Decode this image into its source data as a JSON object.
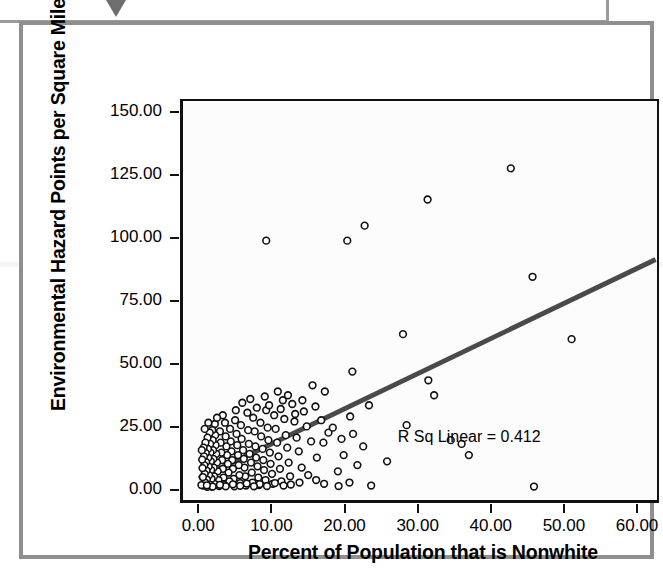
{
  "figure": {
    "marker_icon": "triangle-down-icon",
    "rsq_annotation": "R Sq Linear = 0.412"
  },
  "chart_data": {
    "type": "scatter",
    "title": "",
    "xlabel": "Percent of Population that is Nonwhite",
    "ylabel": "Environmental Hazard Points per Square Mile",
    "xlim": [
      -2.5,
      63.0
    ],
    "ylim": [
      -5.0,
      155.0
    ],
    "xticks": [
      0,
      10,
      20,
      30,
      40,
      50,
      60
    ],
    "xtick_labels": [
      "0.00",
      "10.00",
      "20.00",
      "30.00",
      "40.00",
      "50.00",
      "60.00"
    ],
    "yticks": [
      0,
      25,
      50,
      75,
      100,
      125,
      150
    ],
    "ytick_labels": [
      "0.00",
      "25.00",
      "50.00",
      "75.00",
      "100.00",
      "125.00",
      "150.00"
    ],
    "grid": false,
    "legend": null,
    "marker": {
      "style": "open-circle",
      "radius": 3.4,
      "edge_color": "#111111",
      "face_color": "#ffffff",
      "edge_width": 1.6
    },
    "annotations": [
      {
        "text": "R Sq Linear = 0.412",
        "x": 38.5,
        "y": 21.5
      }
    ],
    "fit_line": {
      "type": "linear",
      "r_squared": 0.412,
      "color": "#4a4a4a",
      "width": 5,
      "x_start": 0.0,
      "y_start": 4.0,
      "x_end": 62.5,
      "y_end": 91.0
    },
    "points": [
      [
        9.0,
        99.0
      ],
      [
        20.2,
        99.0
      ],
      [
        22.6,
        105.0
      ],
      [
        31.3,
        115.5
      ],
      [
        42.8,
        128.0
      ],
      [
        45.8,
        84.5
      ],
      [
        51.2,
        59.5
      ],
      [
        27.9,
        61.5
      ],
      [
        31.4,
        43.0
      ],
      [
        32.2,
        37.0
      ],
      [
        20.9,
        46.5
      ],
      [
        23.2,
        33.0
      ],
      [
        17.1,
        38.5
      ],
      [
        15.4,
        41.0
      ],
      [
        28.4,
        25.0
      ],
      [
        34.5,
        19.0
      ],
      [
        37.0,
        13.0
      ],
      [
        36.0,
        17.5
      ],
      [
        46.0,
        0.4
      ],
      [
        25.7,
        10.5
      ],
      [
        22.4,
        16.5
      ],
      [
        21.0,
        21.5
      ],
      [
        20.6,
        28.5
      ],
      [
        19.7,
        13.0
      ],
      [
        18.9,
        6.5
      ],
      [
        17.6,
        22.0
      ],
      [
        16.6,
        27.0
      ],
      [
        16.0,
        12.0
      ],
      [
        15.2,
        18.5
      ],
      [
        14.6,
        24.5
      ],
      [
        14.2,
        30.5
      ],
      [
        13.9,
        8.0
      ],
      [
        13.5,
        14.5
      ],
      [
        13.2,
        20.0
      ],
      [
        12.9,
        26.5
      ],
      [
        12.6,
        33.5
      ],
      [
        12.3,
        4.5
      ],
      [
        12.1,
        10.0
      ],
      [
        11.9,
        16.0
      ],
      [
        11.7,
        21.0
      ],
      [
        11.5,
        27.5
      ],
      [
        11.3,
        35.0
      ],
      [
        11.1,
        2.5
      ],
      [
        10.9,
        7.5
      ],
      [
        10.7,
        12.5
      ],
      [
        10.5,
        18.0
      ],
      [
        10.3,
        23.5
      ],
      [
        10.1,
        29.0
      ],
      [
        9.9,
        1.5
      ],
      [
        9.8,
        5.5
      ],
      [
        9.6,
        9.5
      ],
      [
        9.5,
        14.0
      ],
      [
        9.3,
        19.0
      ],
      [
        9.2,
        24.0
      ],
      [
        9.0,
        31.0
      ],
      [
        8.9,
        3.0
      ],
      [
        8.7,
        7.0
      ],
      [
        8.6,
        11.0
      ],
      [
        8.5,
        15.5
      ],
      [
        8.3,
        20.5
      ],
      [
        8.2,
        26.0
      ],
      [
        8.0,
        1.0
      ],
      [
        7.9,
        4.0
      ],
      [
        7.8,
        8.5
      ],
      [
        7.6,
        12.0
      ],
      [
        7.5,
        16.5
      ],
      [
        7.4,
        22.5
      ],
      [
        7.2,
        28.0
      ],
      [
        7.1,
        2.0
      ],
      [
        7.0,
        6.0
      ],
      [
        6.9,
        10.0
      ],
      [
        6.7,
        13.5
      ],
      [
        6.6,
        17.5
      ],
      [
        6.5,
        23.0
      ],
      [
        6.4,
        30.0
      ],
      [
        6.2,
        0.8
      ],
      [
        6.1,
        4.5
      ],
      [
        6.0,
        8.0
      ],
      [
        5.9,
        11.5
      ],
      [
        5.8,
        15.0
      ],
      [
        5.6,
        19.5
      ],
      [
        5.5,
        25.0
      ],
      [
        5.4,
        1.8
      ],
      [
        5.3,
        5.0
      ],
      [
        5.2,
        9.0
      ],
      [
        5.1,
        13.0
      ],
      [
        5.0,
        17.0
      ],
      [
        4.9,
        21.5
      ],
      [
        4.7,
        27.0
      ],
      [
        4.6,
        0.5
      ],
      [
        4.5,
        3.5
      ],
      [
        4.4,
        7.5
      ],
      [
        4.3,
        11.0
      ],
      [
        4.2,
        14.5
      ],
      [
        4.1,
        18.5
      ],
      [
        4.0,
        23.5
      ],
      [
        3.9,
        2.5
      ],
      [
        3.8,
        6.0
      ],
      [
        3.7,
        9.5
      ],
      [
        3.6,
        13.0
      ],
      [
        3.5,
        16.5
      ],
      [
        3.4,
        20.5
      ],
      [
        3.3,
        26.0
      ],
      [
        3.2,
        1.0
      ],
      [
        3.1,
        4.0
      ],
      [
        3.0,
        7.5
      ],
      [
        2.9,
        11.0
      ],
      [
        2.8,
        14.0
      ],
      [
        2.7,
        18.0
      ],
      [
        2.6,
        22.5
      ],
      [
        2.5,
        0.6
      ],
      [
        2.4,
        3.0
      ],
      [
        2.3,
        6.5
      ],
      [
        2.2,
        10.0
      ],
      [
        2.1,
        13.5
      ],
      [
        2.0,
        17.0
      ],
      [
        1.95,
        21.0
      ],
      [
        1.9,
        25.5
      ],
      [
        1.85,
        1.5
      ],
      [
        1.8,
        4.5
      ],
      [
        1.75,
        8.0
      ],
      [
        1.7,
        11.5
      ],
      [
        1.65,
        15.0
      ],
      [
        1.6,
        19.0
      ],
      [
        1.55,
        23.0
      ],
      [
        1.5,
        0.4
      ],
      [
        1.45,
        3.5
      ],
      [
        1.4,
        7.0
      ],
      [
        1.35,
        10.5
      ],
      [
        1.3,
        14.0
      ],
      [
        1.25,
        17.5
      ],
      [
        1.2,
        22.0
      ],
      [
        1.15,
        1.2
      ],
      [
        1.1,
        5.0
      ],
      [
        1.05,
        8.5
      ],
      [
        1.0,
        12.0
      ],
      [
        0.95,
        15.5
      ],
      [
        0.9,
        20.0
      ],
      [
        0.85,
        0.3
      ],
      [
        0.8,
        3.2
      ],
      [
        0.75,
        6.8
      ],
      [
        0.7,
        10.2
      ],
      [
        0.65,
        13.8
      ],
      [
        0.6,
        18.0
      ],
      [
        0.55,
        2.0
      ],
      [
        0.5,
        5.5
      ],
      [
        0.45,
        9.0
      ],
      [
        0.4,
        12.5
      ],
      [
        0.35,
        16.0
      ],
      [
        0.3,
        0.8
      ],
      [
        0.25,
        4.2
      ],
      [
        0.2,
        7.8
      ],
      [
        0.15,
        11.2
      ],
      [
        0.1,
        15.0
      ],
      [
        0.05,
        1.0
      ],
      [
        6.8,
        35.5
      ],
      [
        7.7,
        32.0
      ],
      [
        8.8,
        36.5
      ],
      [
        9.4,
        33.0
      ],
      [
        10.6,
        38.5
      ],
      [
        11.0,
        31.5
      ],
      [
        12.0,
        37.0
      ],
      [
        13.0,
        29.5
      ],
      [
        14.0,
        35.0
      ],
      [
        5.7,
        34.0
      ],
      [
        4.8,
        31.0
      ],
      [
        3.0,
        29.0
      ],
      [
        2.2,
        28.0
      ],
      [
        1.0,
        26.0
      ],
      [
        0.5,
        23.5
      ],
      [
        15.8,
        32.5
      ],
      [
        16.9,
        18.0
      ],
      [
        18.2,
        24.0
      ],
      [
        19.4,
        19.5
      ],
      [
        21.6,
        9.0
      ],
      [
        13.6,
        2.0
      ],
      [
        14.8,
        5.0
      ],
      [
        15.9,
        3.0
      ],
      [
        17.0,
        1.5
      ],
      [
        12.4,
        1.2
      ],
      [
        11.4,
        0.8
      ],
      [
        10.2,
        1.8
      ],
      [
        9.1,
        0.6
      ],
      [
        8.1,
        1.4
      ],
      [
        7.3,
        0.5
      ],
      [
        6.3,
        1.6
      ],
      [
        5.4,
        0.7
      ],
      [
        4.4,
        1.3
      ],
      [
        3.4,
        0.5
      ],
      [
        2.6,
        1.1
      ],
      [
        1.6,
        0.4
      ],
      [
        0.8,
        0.9
      ],
      [
        19.0,
        0.6
      ],
      [
        20.5,
        2.0
      ],
      [
        23.5,
        0.8
      ]
    ]
  }
}
